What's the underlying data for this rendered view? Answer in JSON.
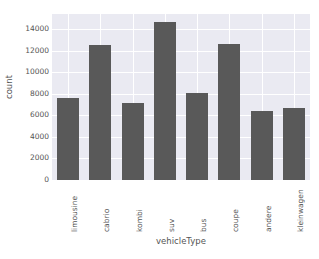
{
  "chart_data": {
    "type": "bar",
    "title": "",
    "xlabel": "vehicleType",
    "ylabel": "count",
    "categories": [
      "limousine",
      "cabrio",
      "kombi",
      "suv",
      "bus",
      "coupe",
      "andere",
      "kleinwagen"
    ],
    "values": [
      7650,
      12500,
      7150,
      14650,
      8050,
      12650,
      6400,
      6700
    ],
    "ylim": [
      0,
      15400
    ],
    "yticks": [
      0,
      2000,
      4000,
      6000,
      8000,
      10000,
      12000,
      14000
    ],
    "ytick_labels": [
      "0",
      "2000",
      "4000",
      "6000",
      "8000",
      "10000",
      "12000",
      "14000"
    ],
    "grid": true,
    "legend": "none",
    "bar_color": "#595959",
    "plot_background": "#eaeaf2",
    "grid_color": "#ffffff",
    "figure_background": "#ffffff",
    "text_color": "#555555"
  }
}
